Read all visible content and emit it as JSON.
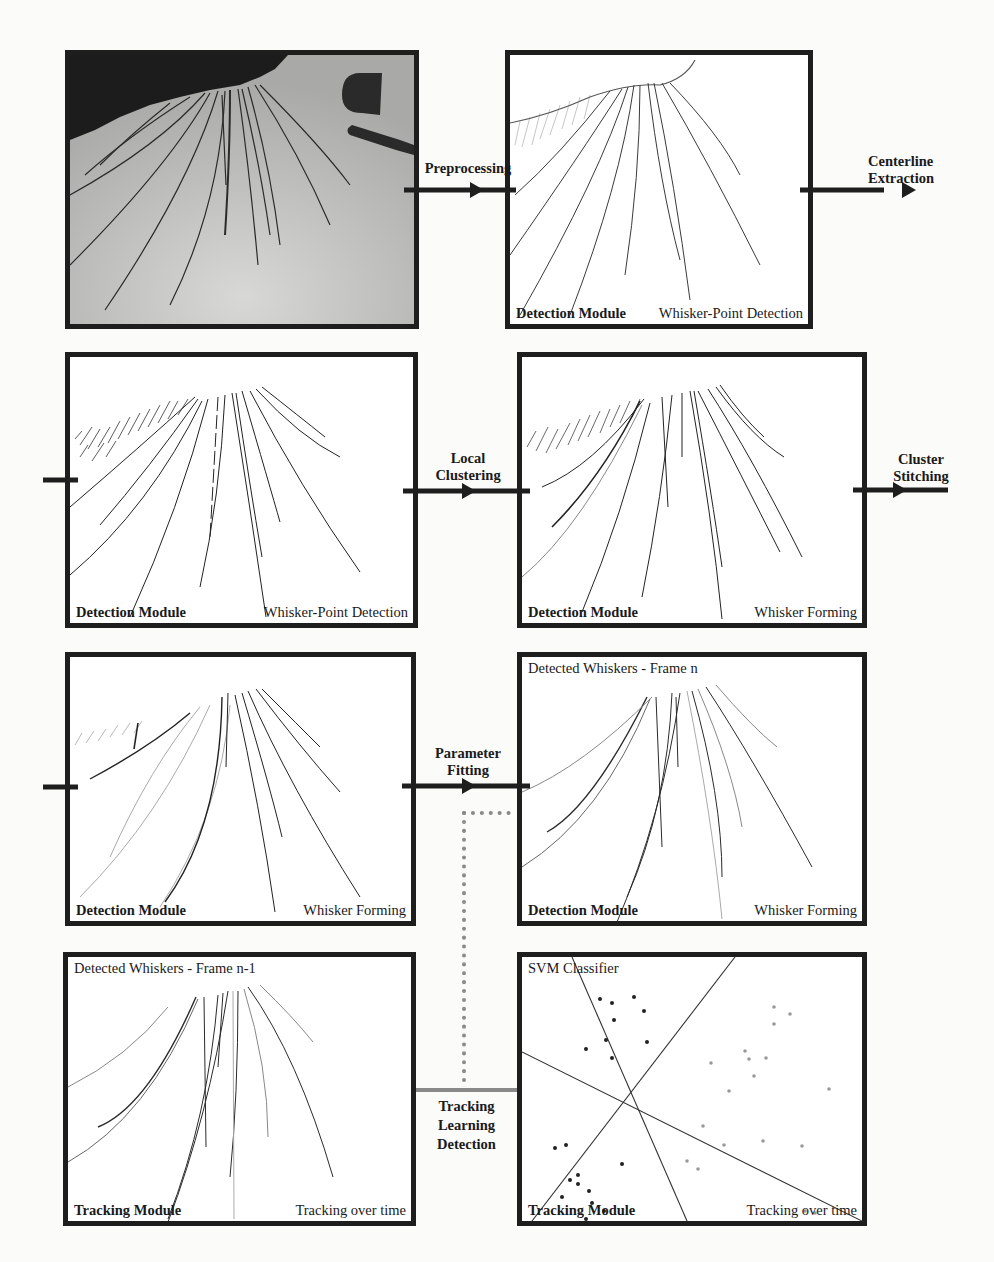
{
  "figure": {
    "panels": [
      {
        "id": "raw-frame",
        "top_left": "",
        "bottom_left": "",
        "bottom_right": ""
      },
      {
        "id": "preprocessed",
        "top_left": "",
        "bottom_left": "Detection Module",
        "bottom_right": "Whisker-Point Detection"
      },
      {
        "id": "centerline",
        "top_left": "",
        "bottom_left": "Detection Module",
        "bottom_right": "Whisker-Point Detection"
      },
      {
        "id": "local-clusters",
        "top_left": "",
        "bottom_left": "Detection Module",
        "bottom_right": "Whisker Forming"
      },
      {
        "id": "stitched",
        "top_left": "",
        "bottom_left": "Detection Module",
        "bottom_right": "Whisker Forming"
      },
      {
        "id": "frame-n",
        "top_left": "Detected Whiskers - Frame n",
        "bottom_left": "Detection Module",
        "bottom_right": "Whisker Forming"
      },
      {
        "id": "frame-n-1",
        "top_left": "Detected Whiskers - Frame n-1",
        "bottom_left": "Tracking Module",
        "bottom_right": "Tracking over time"
      },
      {
        "id": "svm",
        "top_left": "SVM Classifier",
        "bottom_left": "Tracking Module",
        "bottom_right": "Tracking over time"
      }
    ],
    "steps": {
      "preprocessing": "Preprocessing",
      "centerline_1": "Centerline",
      "centerline_2": "Extraction",
      "local_1": "Local",
      "local_2": "Clustering",
      "stitch_1": "Cluster",
      "stitch_2": "Stitching",
      "param_1": "Parameter",
      "param_2": "Fitting",
      "tld_1": "Tracking",
      "tld_2": "Learning",
      "tld_3": "Detection"
    },
    "colors": {
      "border": "#1e1e1e",
      "raw_background": "#b8b8b6",
      "fur": "#1c1c1c",
      "whisker": "#2a2a2a",
      "tld_link": "#8a8a8a",
      "dotted_link": "#888888"
    }
  }
}
